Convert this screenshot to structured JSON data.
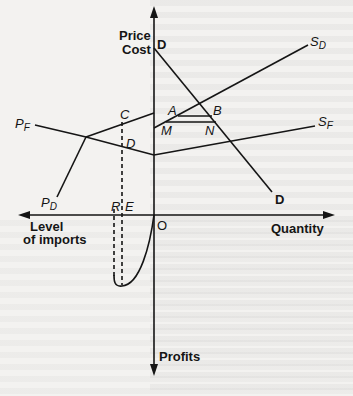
{
  "diagram": {
    "axes": {
      "vertical_up_label_line1": "Price",
      "vertical_up_label_line2": "Cost",
      "vertical_down_label": "Profits",
      "horizontal_right_label": "Quantity",
      "horizontal_left_label_line1": "Level",
      "horizontal_left_label_line2": "of imports",
      "origin_label": "O"
    },
    "curves": {
      "demand_top_label": "D",
      "demand_bottom_label": "D",
      "domestic_supply_label": "S",
      "domestic_supply_sub": "D",
      "foreign_supply_label": "S",
      "foreign_supply_sub": "F",
      "foreign_price_label": "P",
      "foreign_price_sub": "F",
      "domestic_price_label": "P",
      "domestic_price_sub": "D"
    },
    "points": {
      "A": "A",
      "B": "B",
      "M": "M",
      "N": "N",
      "C": "C",
      "D": "D",
      "R": "R",
      "E": "E"
    },
    "colors": {
      "ink": "#151515",
      "paper": "#f3f2f0"
    }
  }
}
